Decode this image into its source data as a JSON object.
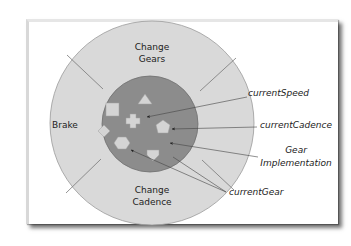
{
  "diagram": {
    "colors": {
      "outer_ring": "#d9d9d9",
      "inner_core": "#8c8c8c",
      "shape_fill": "#d4d4d4",
      "line": "#555555",
      "frame_bg": "#ffffff"
    },
    "methods": [
      {
        "id": "change-gears",
        "line1": "Change",
        "line2": "Gears"
      },
      {
        "id": "brake",
        "label": "Brake"
      },
      {
        "id": "change-cadence",
        "line1": "Change",
        "line2": "Cadence"
      }
    ],
    "fields": [
      {
        "id": "current-speed",
        "label": "currentSpeed",
        "shape": "cross"
      },
      {
        "id": "current-cadence",
        "label": "currentCadence",
        "shape": "pentagon"
      },
      {
        "id": "gear-implementation",
        "line1": "Gear",
        "line2": "Implementation",
        "shape": "none"
      },
      {
        "id": "current-gear",
        "label": "currentGear",
        "shape": "hexagon"
      }
    ],
    "other_shapes": [
      "square",
      "triangle",
      "diamond",
      "shield"
    ]
  }
}
